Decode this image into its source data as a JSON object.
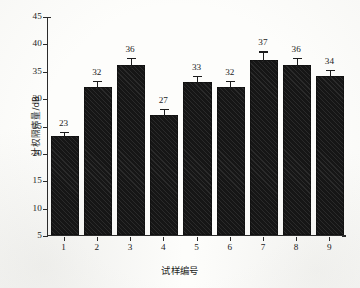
{
  "chart_data": {
    "type": "bar",
    "title": "",
    "subtitle": "",
    "xlabel": "试样编号",
    "ylabel": "计权隔声量/dB",
    "categories": [
      "1",
      "2",
      "3",
      "4",
      "5",
      "6",
      "7",
      "8",
      "9"
    ],
    "values": [
      23,
      32,
      36,
      27,
      33,
      32,
      37,
      36,
      34
    ],
    "value_labels": [
      "23",
      "32",
      "36",
      "27",
      "33",
      "32",
      "37",
      "36",
      "34"
    ],
    "errors": [
      1.0,
      1.3,
      1.5,
      1.2,
      1.3,
      1.3,
      1.7,
      1.5,
      1.3
    ],
    "error_bars": true,
    "ylim": [
      5,
      45
    ],
    "yticks": [
      5,
      10,
      15,
      20,
      25,
      30,
      35,
      40,
      45
    ],
    "ytick_labels": [
      "5",
      "10",
      "15",
      "20",
      "25",
      "30",
      "35",
      "40",
      "45"
    ],
    "xticks": [
      1,
      2,
      3,
      4,
      5,
      6,
      7,
      8,
      9
    ],
    "grid": false,
    "legend": null,
    "legend_position": "none",
    "bar_color": "#161616",
    "bar_hatch": "diagonal",
    "axis_color": "#2b2b2b",
    "background": "#fdfdfb"
  },
  "figure": {
    "background_color": "#fdfdfb",
    "axis_color": "#2b2b2b"
  }
}
